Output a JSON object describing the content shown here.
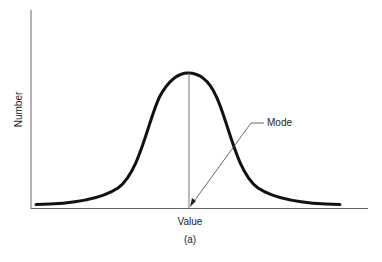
{
  "figure": {
    "y_axis_label": "Number",
    "x_axis_label": "Value",
    "caption": "(a)",
    "annotation": "Mode",
    "curve": "bell-shaped (symmetric unimodal) distribution",
    "colors": {
      "curve": "#111111",
      "axes": "#555555",
      "text": "#222222"
    }
  }
}
